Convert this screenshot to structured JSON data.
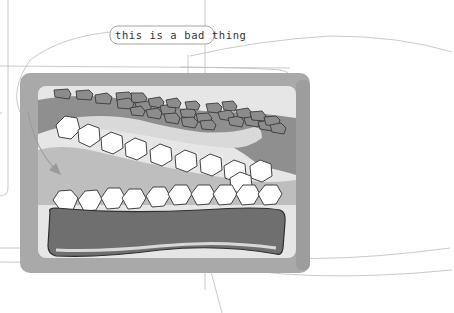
{
  "annotation": {
    "label": "this is a bad thing"
  },
  "colors": {
    "background": "#ffffff",
    "frame_outer": "#a9a9a9",
    "frame_inner": "#e6e6e6",
    "band": "#8f8f8f",
    "bar_fill": "#6f6f6f",
    "bar_outline": "#2e2e2e",
    "chip_fill": "#8c8c8c",
    "chip_outline": "#3a3a3a",
    "hexagon_fill": "#ffffff",
    "hexagon_outline": "#444444",
    "guide_lines": "#b5b5b5",
    "arrow": "#9a9a9a"
  },
  "illustration": {
    "description": "Grayscale cross-section: rows of small dark chips on top, rows of white hexagons in the middle, a long dark rounded bar at the bottom, inside a rounded gray frame",
    "chip_count": 30,
    "upper_hexagon_count": 10,
    "lower_hexagon_count": 10
  }
}
